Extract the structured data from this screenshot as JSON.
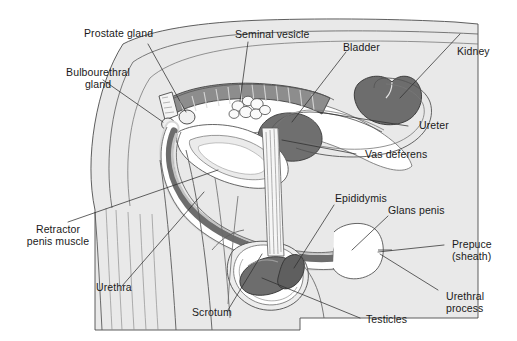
{
  "figure": {
    "background_color": "#ffffff",
    "body_fill_color": "#e8e8e8",
    "body_outline_color": "#555555",
    "organ_dark_color": "#6e6e6e",
    "organ_mid_color": "#9a9a9a",
    "organ_light_color": "#c9c9c9",
    "organ_pale_color": "#f2f2f2",
    "leader_line_color": "#3a3a3a",
    "label_text_color": "#1a1a1a"
  },
  "labels": {
    "prostate_gland": "Prostate gland",
    "bulbourethral_gland_line1": "Bulbourethral",
    "bulbourethral_gland_line2": "gland",
    "seminal_vesicle": "Seminal vesicle",
    "bladder": "Bladder",
    "kidney": "Kidney",
    "ureter": "Ureter",
    "vas_deferens": "Vas deferens",
    "epididymis": "Epididymis",
    "glans_penis": "Glans penis",
    "prepuce_line1": "Prepuce",
    "prepuce_line2": "(sheath)",
    "urethral_process_line1": "Urethral",
    "urethral_process_line2": "process",
    "testicles": "Testicles",
    "scrotum": "Scrotum",
    "urethra": "Urethra",
    "retractor_penis_muscle_line1": "Retractor",
    "retractor_penis_muscle_line2": "penis muscle"
  },
  "parts": [
    {
      "id": "prostate-gland",
      "name": "Prostate gland"
    },
    {
      "id": "bulbourethral-gland",
      "name": "Bulbourethral gland"
    },
    {
      "id": "seminal-vesicle",
      "name": "Seminal vesicle"
    },
    {
      "id": "bladder",
      "name": "Bladder"
    },
    {
      "id": "kidney",
      "name": "Kidney"
    },
    {
      "id": "ureter",
      "name": "Ureter"
    },
    {
      "id": "vas-deferens",
      "name": "Vas deferens"
    },
    {
      "id": "epididymis",
      "name": "Epididymis"
    },
    {
      "id": "glans-penis",
      "name": "Glans penis"
    },
    {
      "id": "prepuce",
      "name": "Prepuce (sheath)"
    },
    {
      "id": "urethral-process",
      "name": "Urethral process"
    },
    {
      "id": "testicles",
      "name": "Testicles"
    },
    {
      "id": "scrotum",
      "name": "Scrotum"
    },
    {
      "id": "urethra",
      "name": "Urethra"
    },
    {
      "id": "retractor-penis-muscle",
      "name": "Retractor penis muscle"
    },
    {
      "id": "rectum",
      "name": "Rectum"
    }
  ]
}
